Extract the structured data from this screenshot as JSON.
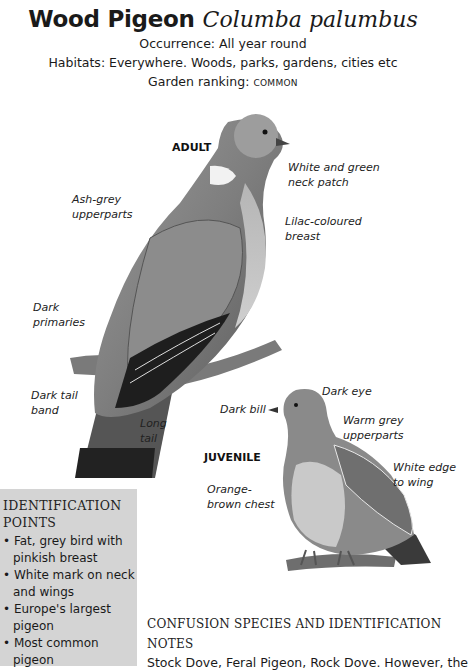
{
  "header": {
    "common_name": "Wood Pigeon",
    "latin_name": "Columba palumbus",
    "occurrence": "Occurrence: All year round",
    "habitats": "Habitats: Everywhere. Woods, parks, gardens, cities etc",
    "ranking_label": "Garden ranking: ",
    "ranking_value": "COMMON"
  },
  "adult": {
    "stage_label": "ADULT",
    "labels": {
      "neck_patch_1": "White and green",
      "neck_patch_2": "neck patch",
      "upperparts_1": "Ash-grey",
      "upperparts_2": "upperparts",
      "breast_1": "Lilac-coloured",
      "breast_2": "breast",
      "primaries_1": "Dark",
      "primaries_2": "primaries",
      "tailband_1": "Dark tail",
      "tailband_2": "band",
      "tail_1": "Long",
      "tail_2": "tail"
    }
  },
  "juvenile": {
    "stage_label": "JUVENILE",
    "labels": {
      "eye": "Dark eye",
      "bill": "Dark bill",
      "upperparts_1": "Warm grey",
      "upperparts_2": "upperparts",
      "wing_edge_1": "White edge",
      "wing_edge_2": "to wing",
      "chest_1": "Orange-",
      "chest_2": "brown chest"
    }
  },
  "identification": {
    "heading_1": "IDENTIFICATION",
    "heading_2": "POINTS",
    "points": [
      "Fat, grey bird with pinkish breast",
      "White mark on neck and wings",
      "Europe's largest pigeon",
      "Most common pigeon"
    ]
  },
  "confusion": {
    "heading_1": "CONFUSION SPECIES AND IDENTIFICATION",
    "heading_2": "NOTES",
    "text": "Stock Dove, Feral Pigeon, Rock Dove. However, the"
  }
}
